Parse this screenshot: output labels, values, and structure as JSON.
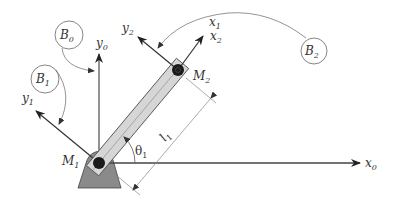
{
  "diagram": {
    "colors": {
      "background": "#ffffff",
      "axis": "#333333",
      "link_fill": "#d6d6d6",
      "link_stroke": "#555555",
      "base_fill": "#8a8a8a",
      "joint": "#1a1a1a",
      "thin_line": "#888888"
    },
    "axes": {
      "x0": {
        "base": "x",
        "sub": "0"
      },
      "y0": {
        "base": "y",
        "sub": "0"
      },
      "y1": {
        "base": "y",
        "sub": "1"
      },
      "x1": {
        "base": "x",
        "sub": "1"
      },
      "x2": {
        "base": "x",
        "sub": "2"
      },
      "y2": {
        "base": "y",
        "sub": "2"
      }
    },
    "points": {
      "M1": {
        "base": "M",
        "sub": "1"
      },
      "M2": {
        "base": "M",
        "sub": "2"
      }
    },
    "bodies": {
      "B0": {
        "base": "B",
        "sub": "0"
      },
      "B1": {
        "base": "B",
        "sub": "1"
      },
      "B2": {
        "base": "B",
        "sub": "2"
      }
    },
    "angle": {
      "base": "θ",
      "sub": "1"
    },
    "length": {
      "base": "l",
      "sub": "1"
    }
  }
}
